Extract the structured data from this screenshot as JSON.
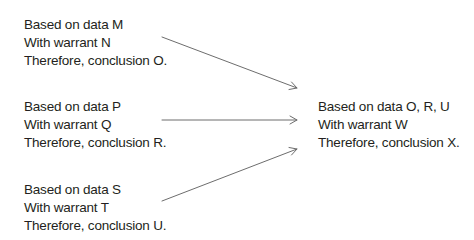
{
  "diagram": {
    "premises": [
      {
        "data": "Based on data M",
        "warrant": "With warrant N",
        "conclusion": "Therefore, conclusion O."
      },
      {
        "data": "Based on data P",
        "warrant": "With warrant Q",
        "conclusion": "Therefore, conclusion R."
      },
      {
        "data": "Based on data S",
        "warrant": "With warrant T",
        "conclusion": "Therefore, conclusion U."
      }
    ],
    "result": {
      "data": "Based on data O, R, U",
      "warrant": "With warrant W",
      "conclusion": "Therefore, conclusion X."
    },
    "arrows": [
      {
        "from": "premise-1",
        "to": "result"
      },
      {
        "from": "premise-2",
        "to": "result"
      },
      {
        "from": "premise-3",
        "to": "result"
      }
    ],
    "colors": {
      "text": "#231f20",
      "arrow": "#6d6d6d"
    }
  }
}
